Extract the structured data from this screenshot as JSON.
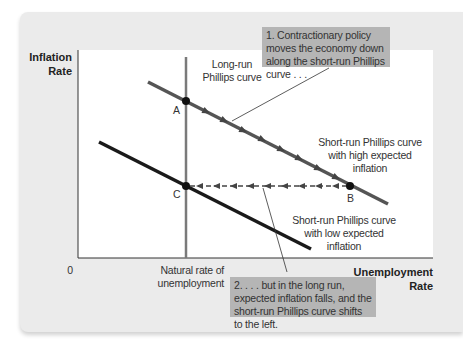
{
  "figure": {
    "y_axis_label_line1": "Inflation",
    "y_axis_label_line2": "Rate",
    "x_axis_label_line1": "Unemployment",
    "x_axis_label_line2": "Rate",
    "origin_label": "0",
    "natural_rate_line1": "Natural rate of",
    "natural_rate_line2": "unemployment",
    "lrpc_line1": "Long-run",
    "lrpc_line2": "Phillips curve",
    "srpc_high_line1": "Short-run Phillips curve",
    "srpc_high_line2": "with high expected",
    "srpc_high_line3": "inflation",
    "srpc_low_line1": "Short-run Phillips curve",
    "srpc_low_line2": "with low expected",
    "srpc_low_line3": "inflation",
    "point_a": "A",
    "point_b": "B",
    "point_c": "C",
    "callout1": "1. Contractionary policy moves the economy down along the short-run Phillips curve . . .",
    "callout2": "2. . . . but in the long run, expected inflation falls, and the short-run Phillips curve shifts to the left."
  },
  "colors": {
    "panel_bg": "#ebebeb",
    "plot_bg": "#ffffff",
    "high_curve": "#555555",
    "low_curve": "#1a1a1a",
    "lrpc": "#7a7a7a",
    "callout_bg": "#b5b5b5"
  }
}
